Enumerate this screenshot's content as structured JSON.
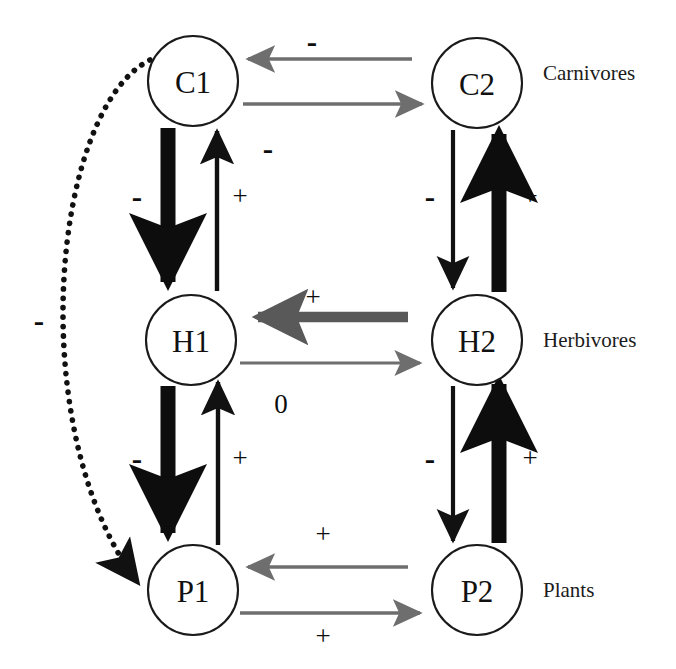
{
  "figure": {
    "background_color": "#ffffff",
    "width": 676,
    "height": 669
  },
  "palette": {
    "node_stroke": "#1a1a1a",
    "node_fill": "#ffffff",
    "thick_arrow": "#0d0d0d",
    "thin_arrow": "#111111",
    "gray_arrow": "#6e6e6e",
    "dark_gray_arrow": "#595959",
    "dotted_arrow": "#111111",
    "text": "#111111"
  },
  "nodes": [
    {
      "id": "C1",
      "label": "C1",
      "cx": 193,
      "cy": 81,
      "r": 45
    },
    {
      "id": "C2",
      "label": "C2",
      "cx": 477,
      "cy": 83,
      "r": 45
    },
    {
      "id": "H1",
      "label": "H1",
      "cx": 191,
      "cy": 340,
      "r": 45
    },
    {
      "id": "H2",
      "label": "H2",
      "cx": 477,
      "cy": 340,
      "r": 45
    },
    {
      "id": "P1",
      "label": "P1",
      "cx": 193,
      "cy": 590,
      "r": 45
    },
    {
      "id": "P2",
      "label": "P2",
      "cx": 477,
      "cy": 590,
      "r": 45
    }
  ],
  "trophic_labels": [
    {
      "id": "carnivores",
      "text": "Carnivores",
      "x": 543,
      "y": 73
    },
    {
      "id": "herbivores",
      "text": "Herbivores",
      "x": 543,
      "y": 340
    },
    {
      "id": "plants",
      "text": "Plants",
      "x": 543,
      "y": 590
    }
  ],
  "edges": [
    {
      "id": "c1-h1",
      "from": "C1",
      "to": "H1",
      "sign": "-",
      "style": "thick-black",
      "orientation": "vertical-down",
      "column": "left"
    },
    {
      "id": "h1-c1",
      "from": "H1",
      "to": "C1",
      "sign": "+",
      "style": "thin-black",
      "orientation": "vertical-up",
      "column": "left"
    },
    {
      "id": "h1-p1",
      "from": "H1",
      "to": "P1",
      "sign": "-",
      "style": "thick-black",
      "orientation": "vertical-down",
      "column": "left"
    },
    {
      "id": "p1-h1",
      "from": "P1",
      "to": "H1",
      "sign": "+",
      "style": "thin-black",
      "orientation": "vertical-up",
      "column": "left"
    },
    {
      "id": "c2-h2",
      "from": "C2",
      "to": "H2",
      "sign": "-",
      "style": "thin-black",
      "orientation": "vertical-down",
      "column": "right"
    },
    {
      "id": "h2-c2",
      "from": "H2",
      "to": "C2",
      "sign": "+",
      "style": "thick-black",
      "orientation": "vertical-up",
      "column": "right"
    },
    {
      "id": "h2-p2",
      "from": "H2",
      "to": "P2",
      "sign": "-",
      "style": "thin-black",
      "orientation": "vertical-down",
      "column": "right"
    },
    {
      "id": "p2-h2",
      "from": "P2",
      "to": "H2",
      "sign": "+",
      "style": "thick-black",
      "orientation": "vertical-up",
      "column": "right"
    },
    {
      "id": "c2-c1",
      "from": "C2",
      "to": "C1",
      "sign": "-",
      "style": "thin-gray",
      "orientation": "horizontal-left",
      "row": "carnivores"
    },
    {
      "id": "c1-c2",
      "from": "C1",
      "to": "C2",
      "sign": "-",
      "style": "thin-gray",
      "orientation": "horizontal-right",
      "row": "carnivores"
    },
    {
      "id": "h2-h1",
      "from": "H2",
      "to": "H1",
      "sign": "+",
      "style": "thick-gray",
      "orientation": "horizontal-left",
      "row": "herbivores"
    },
    {
      "id": "h1-h2",
      "from": "H1",
      "to": "H2",
      "sign": "0",
      "style": "thin-gray",
      "orientation": "horizontal-right",
      "row": "herbivores"
    },
    {
      "id": "p2-p1",
      "from": "P2",
      "to": "P1",
      "sign": "+",
      "style": "thin-gray",
      "orientation": "horizontal-left",
      "row": "plants"
    },
    {
      "id": "p1-p2",
      "from": "P1",
      "to": "P2",
      "sign": "+",
      "style": "thin-gray",
      "orientation": "horizontal-right",
      "row": "plants"
    },
    {
      "id": "c1-p1",
      "from": "C1",
      "to": "P1",
      "sign": "-",
      "style": "dotted-black",
      "orientation": "curve-left",
      "row": "cross-trophic"
    }
  ],
  "sign_labels": [
    {
      "id": "sign-c1-h1",
      "text": "-",
      "x": 137,
      "y": 196
    },
    {
      "id": "sign-h1-c1",
      "text": "+",
      "x": 240,
      "y": 196
    },
    {
      "id": "sign-h1-p1",
      "text": "-",
      "x": 137,
      "y": 458
    },
    {
      "id": "sign-p1-h1",
      "text": "+",
      "x": 240,
      "y": 458
    },
    {
      "id": "sign-c2-h2",
      "text": "-",
      "x": 430,
      "y": 196
    },
    {
      "id": "sign-h2-c2",
      "text": "+",
      "x": 530,
      "y": 196
    },
    {
      "id": "sign-h2-p2",
      "text": "-",
      "x": 430,
      "y": 458
    },
    {
      "id": "sign-p2-h2",
      "text": "+",
      "x": 530,
      "y": 458
    },
    {
      "id": "sign-c2-c1",
      "text": "-",
      "x": 312,
      "y": 41
    },
    {
      "id": "sign-c1-c2",
      "text": "-",
      "x": 268,
      "y": 148
    },
    {
      "id": "sign-h2-h1",
      "text": "+",
      "x": 313,
      "y": 297
    },
    {
      "id": "sign-h1-h2",
      "text": "0",
      "x": 281,
      "y": 404
    },
    {
      "id": "sign-p2-p1",
      "text": "+",
      "x": 323,
      "y": 534
    },
    {
      "id": "sign-p1-p2",
      "text": "+",
      "x": 323,
      "y": 636
    },
    {
      "id": "sign-c1-p1",
      "text": "-",
      "x": 39,
      "y": 320
    }
  ]
}
